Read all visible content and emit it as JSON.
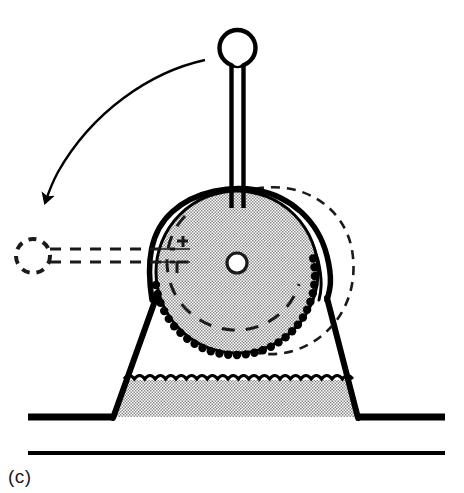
{
  "figure": {
    "label": "(c)",
    "caption_position": "bottom-left",
    "background_color": "#ffffff",
    "ink_color": "#000000",
    "stipple_color": "#9a9a9a",
    "width": 464,
    "height": 493
  },
  "diagram": {
    "title": "",
    "type": "mechanical-schematic",
    "parts": [
      {
        "id": "handle-knob",
        "name": "handle-knob",
        "label": "Handle knob",
        "style": "solid",
        "cx": 237,
        "cy": 48,
        "r": 18
      },
      {
        "id": "handle-rod",
        "name": "handle-rod",
        "label": "Handle rod",
        "style": "solid",
        "x": 237,
        "y_top": 64,
        "y_bottom": 205,
        "width": 11
      },
      {
        "id": "wheel",
        "name": "toothed-wheel",
        "label": "Toothed wheel",
        "style": "solid-stippled",
        "cx": 237,
        "cy": 272,
        "r": 82,
        "teeth": 44
      },
      {
        "id": "wheel-hub",
        "name": "wheel-hub",
        "label": "Hub / axle hole",
        "style": "solid",
        "cx": 237,
        "cy": 263,
        "r": 10
      },
      {
        "id": "wheel-inner-arc",
        "name": "wheel-inner-dashed-arc",
        "label": "Inner dashed reference arc",
        "style": "dashed"
      },
      {
        "id": "cradle-band",
        "name": "cradle-band",
        "label": "Cradle band / strap",
        "style": "solid-double-line"
      },
      {
        "id": "base",
        "name": "trapezoidal-base",
        "label": "Trapezoidal base",
        "style": "solid",
        "top_left_x": 155,
        "top_right_x": 328,
        "bottom_left_x": 113,
        "bottom_right_x": 358,
        "top_y": 300,
        "bottom_y": 417
      },
      {
        "id": "base-fill",
        "name": "base-stippled-fill",
        "label": "Stippled fill region of base",
        "style": "stippled",
        "top_y": 378
      },
      {
        "id": "ground-line-upper",
        "name": "ground-line-upper",
        "label": "Upper ground line",
        "style": "solid-thick",
        "y": 417,
        "x_start": 28,
        "x_end": 445
      },
      {
        "id": "ground-line-lower",
        "name": "ground-line-lower",
        "label": "Lower ground line",
        "style": "solid-thin",
        "y": 453,
        "x_start": 28,
        "x_end": 445
      },
      {
        "id": "ghost-handle",
        "name": "ghost-handle-dashed",
        "label": "Rotated handle position (dashed)",
        "style": "dashed",
        "knob_cx": 33,
        "knob_cy": 256,
        "knob_r": 17
      },
      {
        "id": "ghost-wheel-arc",
        "name": "ghost-wheel-dashed-arc",
        "label": "Displaced wheel outline (dashed)",
        "style": "dashed"
      },
      {
        "id": "rotation-arrow",
        "name": "rotation-arrow",
        "label": "Rotation direction arrow",
        "style": "solid-curved-arrow",
        "direction": "counterclockwise"
      }
    ]
  }
}
